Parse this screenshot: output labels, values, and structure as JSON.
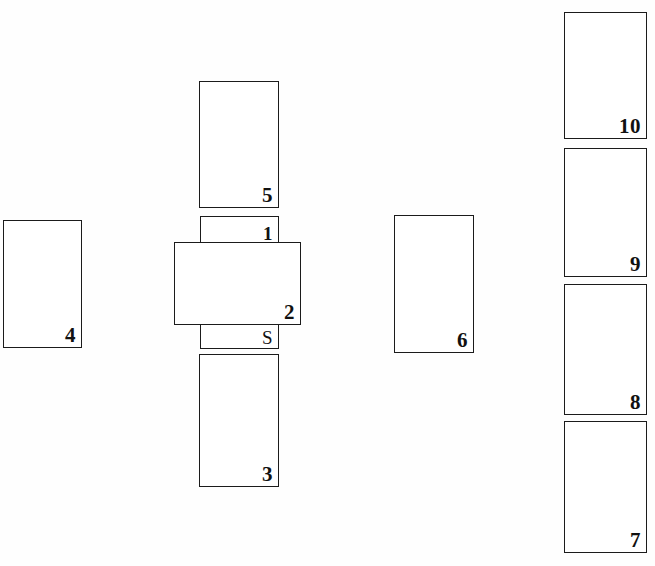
{
  "figure": {
    "background_color": "#fefefe",
    "stroke_color": "#1b1b1b",
    "label_color": "#111111",
    "width": 655,
    "height": 566,
    "groups": {
      "left_group": "left-standalone-block",
      "center_group": "center-stacked-assembly",
      "middle_right_group": "middle-right-standalone-block",
      "right_group": "right-stacked-column"
    }
  },
  "blocks": [
    {
      "id": "block-4",
      "label": "4",
      "group": "left_group",
      "x": 3,
      "y": 220,
      "width": 79,
      "height": 128,
      "overlaps": false
    },
    {
      "id": "block-5",
      "label": "5",
      "group": "center_group",
      "x": 199,
      "y": 81,
      "width": 80,
      "height": 127,
      "overlaps": false
    },
    {
      "id": "block-1",
      "label": "1",
      "group": "center_group",
      "x": 200,
      "y": 216,
      "width": 79,
      "height": 30,
      "overlaps": true
    },
    {
      "id": "block-2",
      "label": "2",
      "group": "center_group",
      "x": 174,
      "y": 242,
      "width": 127,
      "height": 83,
      "overlaps": true
    },
    {
      "id": "block-s",
      "label": "S",
      "group": "center_group",
      "x": 200,
      "y": 321,
      "width": 79,
      "height": 28,
      "overlaps": true
    },
    {
      "id": "block-3",
      "label": "3",
      "group": "center_group",
      "x": 199,
      "y": 354,
      "width": 80,
      "height": 133,
      "overlaps": false
    },
    {
      "id": "block-6",
      "label": "6",
      "group": "middle_right_group",
      "x": 394,
      "y": 215,
      "width": 80,
      "height": 138,
      "overlaps": false
    },
    {
      "id": "block-10",
      "label": "10",
      "group": "right_group",
      "x": 564,
      "y": 12,
      "width": 83,
      "height": 127,
      "overlaps": false
    },
    {
      "id": "block-9",
      "label": "9",
      "group": "right_group",
      "x": 564,
      "y": 148,
      "width": 83,
      "height": 129,
      "overlaps": false
    },
    {
      "id": "block-8",
      "label": "8",
      "group": "right_group",
      "x": 564,
      "y": 284,
      "width": 83,
      "height": 131,
      "overlaps": false
    },
    {
      "id": "block-7",
      "label": "7",
      "group": "right_group",
      "x": 564,
      "y": 421,
      "width": 83,
      "height": 132,
      "overlaps": false
    }
  ]
}
